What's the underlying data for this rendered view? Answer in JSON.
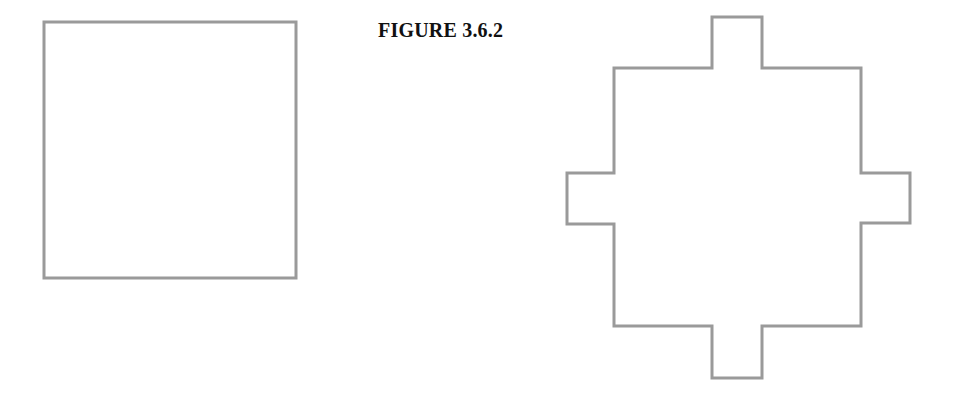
{
  "figure": {
    "caption": "FIGURE 3.6.2",
    "stroke_color": "#9a9a9a",
    "stroke_width": 3,
    "shapes": [
      {
        "name": "square",
        "points": "44,22 296,22 296,278 44,278"
      },
      {
        "name": "cross-shape",
        "points": "614,68 712,68 712,17 762,17 762,68 861,68 861,173 910,173 910,223 861,223 861,326 762,326 762,378 712,378 712,326 614,326 614,224 567,224 567,173 614,173"
      }
    ]
  }
}
